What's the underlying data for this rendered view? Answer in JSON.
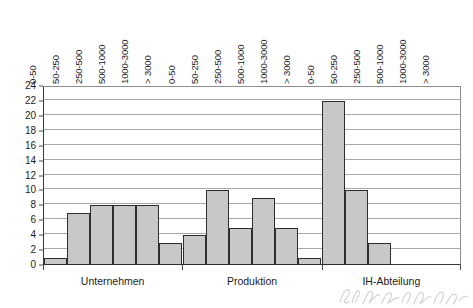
{
  "chart_data": {
    "type": "bar",
    "title": "",
    "subtitle": "",
    "xlabel": "",
    "ylabel": "",
    "ylim": [
      0,
      24
    ],
    "ytick_step": 2,
    "yticks": [
      0,
      2,
      4,
      6,
      8,
      10,
      12,
      14,
      16,
      18,
      20,
      22,
      24
    ],
    "grid": true,
    "legend": "none",
    "orientation": "vertical",
    "categories": [
      "0-50",
      "50-250",
      "250-500",
      "500-1000",
      "1000-3000",
      "> 3000"
    ],
    "groups": [
      "Unternehmen",
      "Produktion",
      "IH-Abteilung"
    ],
    "series": [
      {
        "name": "Unternehmen",
        "values": [
          1,
          7,
          8,
          8,
          8,
          3
        ]
      },
      {
        "name": "Produktion",
        "values": [
          4,
          10,
          5,
          9,
          5,
          1
        ]
      },
      {
        "name": "IH-Abteilung",
        "values": [
          22,
          10,
          3,
          0,
          0,
          0
        ]
      }
    ]
  },
  "style": {
    "bar_fill": "#c8c8c8",
    "bar_border": "#2e2e2e",
    "grid_color": "#a9a9a9",
    "axis_color": "#3a3a3a",
    "text_color": "#1c1c1c",
    "background": "#ffffff"
  }
}
